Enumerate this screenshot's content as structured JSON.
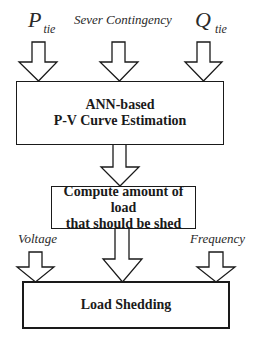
{
  "diagram": {
    "inputs_top": {
      "p_tie": {
        "main": "P",
        "sub": "tie"
      },
      "contingency": "Sever Contingency",
      "q_tie": {
        "main": "Q",
        "sub": "tie"
      }
    },
    "boxes": {
      "estimation": {
        "line1": "ANN-based",
        "line2": "P-V Curve Estimation"
      },
      "compute": {
        "line1": "Compute amount of load",
        "line2": "that should be shed"
      },
      "shedding": "Load Shedding"
    },
    "inputs_bottom": {
      "voltage": "Voltage",
      "frequency": "Frequency"
    },
    "colors": {
      "stroke": "#1a1a1a",
      "fill": "#ffffff",
      "text": "#1a1a1a"
    }
  }
}
